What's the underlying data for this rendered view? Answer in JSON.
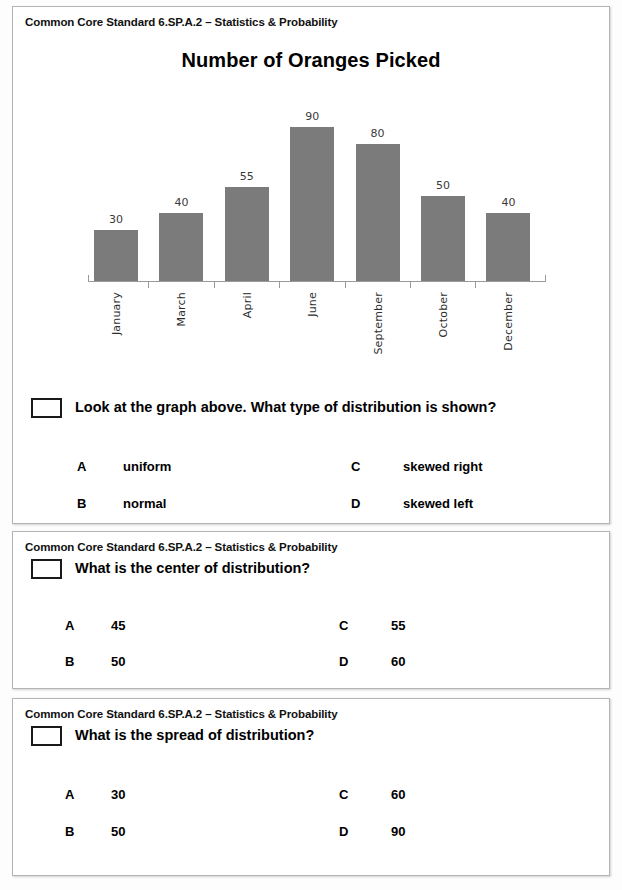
{
  "page": {
    "standard_header": "Common Core Standard 6.SP.A.2 – Statistics & Probability"
  },
  "chart_data": {
    "type": "bar",
    "title": "Number of Oranges Picked",
    "xlabel": "",
    "ylabel": "",
    "categories": [
      "January",
      "March",
      "April",
      "June",
      "September",
      "October",
      "December"
    ],
    "values": [
      30,
      40,
      55,
      90,
      80,
      50,
      40
    ],
    "ylim": [
      0,
      100
    ],
    "grid": false,
    "legend": false,
    "data_labels": true,
    "bar_color": "#7b7b7b",
    "axis_color": "#9a9a9a"
  },
  "questions": [
    {
      "standard": "Common Core Standard 6.SP.A.2 – Statistics & Probability",
      "prompt": "Look at the graph above. What type of distribution is shown?",
      "options": [
        {
          "letter": "A",
          "text": "uniform"
        },
        {
          "letter": "B",
          "text": "normal"
        },
        {
          "letter": "C",
          "text": "skewed right"
        },
        {
          "letter": "D",
          "text": "skewed left"
        }
      ]
    },
    {
      "standard": "Common Core Standard 6.SP.A.2 – Statistics & Probability",
      "prompt": "What is the center of distribution?",
      "options": [
        {
          "letter": "A",
          "text": "45"
        },
        {
          "letter": "B",
          "text": "50"
        },
        {
          "letter": "C",
          "text": "55"
        },
        {
          "letter": "D",
          "text": "60"
        }
      ]
    },
    {
      "standard": "Common Core Standard 6.SP.A.2 – Statistics & Probability",
      "prompt": "What is the spread of distribution?",
      "options": [
        {
          "letter": "A",
          "text": "30"
        },
        {
          "letter": "B",
          "text": "50"
        },
        {
          "letter": "C",
          "text": "60"
        },
        {
          "letter": "D",
          "text": "90"
        }
      ]
    }
  ]
}
